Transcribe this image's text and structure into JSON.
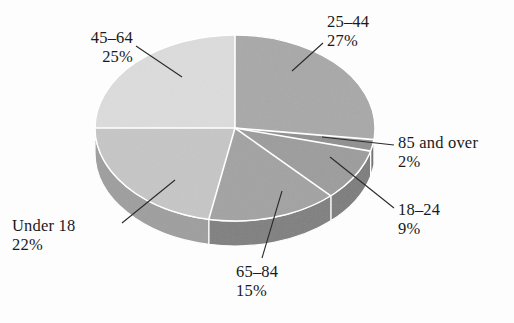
{
  "chart_data": {
    "type": "pie",
    "title": "",
    "subtitle": "",
    "xlabel": "",
    "ylabel": "",
    "legend_position": "none",
    "grid": false,
    "style": "3d-exploded-none",
    "units": "percent",
    "categories": [
      "25–44",
      "85 and over",
      "18–24",
      "65–84",
      "Under 18",
      "45–64"
    ],
    "values": [
      27,
      2,
      9,
      15,
      22,
      25
    ],
    "slices": [
      {
        "label": "25–44",
        "percent": 27,
        "percent_text": "27%",
        "color": "#a8a8a8",
        "side_color": "#8a8a8a",
        "start_angle": 0,
        "end_angle": 97.2
      },
      {
        "label": "85 and over",
        "percent": 2,
        "percent_text": "2%",
        "color": "#8f8f8f",
        "side_color": "#6f6f6f",
        "start_angle": 97.2,
        "end_angle": 104.4
      },
      {
        "label": "18–24",
        "percent": 9,
        "percent_text": "9%",
        "color": "#9c9c9c",
        "side_color": "#7c7c7c",
        "start_angle": 104.4,
        "end_angle": 136.8
      },
      {
        "label": "65–84",
        "percent": 15,
        "percent_text": "15%",
        "color": "#a2a2a2",
        "side_color": "#7f7f7f",
        "start_angle": 136.8,
        "end_angle": 190.8
      },
      {
        "label": "Under 18",
        "percent": 22,
        "percent_text": "22%",
        "color": "#c6c6c6",
        "side_color": "#9e9e9e",
        "start_angle": 190.8,
        "end_angle": 270.0
      },
      {
        "label": "45–64",
        "percent": 25,
        "percent_text": "25%",
        "color": "#dcdcdc",
        "side_color": "#b4b4b4",
        "start_angle": 270.0,
        "end_angle": 360.0
      }
    ]
  },
  "labels": {
    "age_45_64": {
      "category": "45–64",
      "percent": "25%"
    },
    "age_25_44": {
      "category": "25–44",
      "percent": "27%"
    },
    "age_85_over": {
      "category": "85 and over",
      "percent": "2%"
    },
    "age_18_24": {
      "category": "18–24",
      "percent": "9%"
    },
    "age_65_84": {
      "category": "65–84",
      "percent": "15%"
    },
    "age_under_18": {
      "category": "Under 18",
      "percent": "22%"
    }
  },
  "colors": {
    "background": "#fdfdfd",
    "text": "#1a1a1a",
    "leader_line": "#2b2b2b",
    "slice_divider": "#ffffff"
  }
}
